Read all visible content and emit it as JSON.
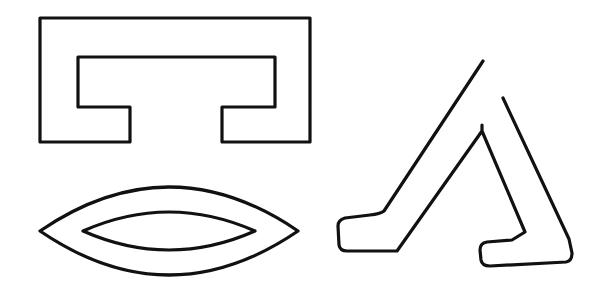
{
  "figure": {
    "background": "#ffffff",
    "stroke_color": "#111111",
    "stroke_width": 3.2,
    "shapes": [
      {
        "id": "bracket-shape",
        "type": "polygon",
        "label": "Rectangular bracket outline",
        "d": "M40,18 L310,18 L310,142 L222,142 L222,107 L275,107 L275,57 L78,57 L78,107 L130,107 L130,142 L40,142 Z"
      },
      {
        "id": "lens-outer",
        "type": "lens",
        "label": "Outer eye/lens outline",
        "d": "M40,231 Q169,143 298,231 Q169,319 40,231 Z"
      },
      {
        "id": "lens-inner",
        "type": "lens",
        "label": "Inner eye/lens outline",
        "d": "M83,231 Q169,193 255,231 Q169,269 83,231 Z"
      },
      {
        "id": "lambda-shape",
        "type": "polyline",
        "label": "Lambda-like angled outline",
        "d": "M483,61 L384,211 Q380,214 370,215 L345,218 Q338,220 338,226 L339,245 Q340,251 347,251 L397,251 L482,131 L482,125 L482,131 L525,232 L512,240 L487,242 Q480,243 480,250 L481,260 Q482,266 490,266 L566,262 Q572,261 572,253 L569,239 L503,98"
      }
    ]
  }
}
